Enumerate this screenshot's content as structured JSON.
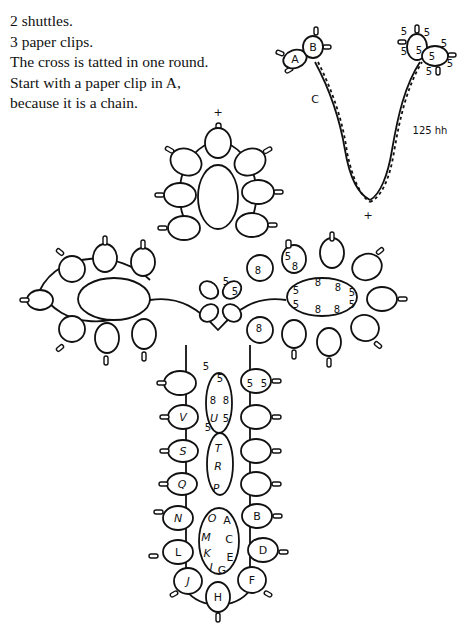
{
  "instructions": [
    "2 shuttles.",
    "3 paper clips.",
    "The cross is tatted in one round.",
    "Start with a paper clip in A,",
    "because it is a chain."
  ],
  "inset": {
    "ring_labels": [
      "A",
      "B"
    ],
    "chain_label": "C",
    "chain_count": "125 hh",
    "cross_mark": "+",
    "right_ring_counts": [
      "5",
      "5",
      "5",
      "5",
      "5",
      "5",
      "5",
      "5"
    ]
  },
  "cross": {
    "top_mark": "+",
    "stem_left_labels": [
      "V",
      "S",
      "Q",
      "N",
      "L",
      "J"
    ],
    "stem_right_labels": [
      "B",
      "D",
      "F"
    ],
    "bottom_label": "H",
    "center_oval_top": [
      "5",
      "8",
      "8",
      "U",
      "5",
      "5",
      "5"
    ],
    "center_oval_mid": [
      "T",
      "R",
      "P"
    ],
    "center_oval_bottom": [
      "O",
      "A",
      "M",
      "C",
      "K",
      "E",
      "I",
      "G"
    ],
    "right_arm_oval_counts": [
      "5",
      "8",
      "8",
      "5",
      "5",
      "8",
      "8",
      "5"
    ],
    "count_marks": "5 / 8"
  }
}
